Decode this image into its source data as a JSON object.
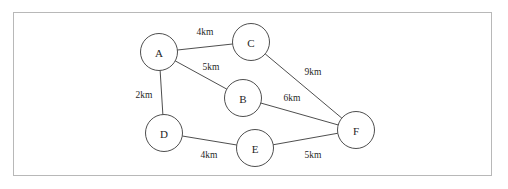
{
  "diagram": {
    "background_color": "#ffffff",
    "frame": {
      "border_color": "#b8b8b8",
      "x": 13,
      "y": 12,
      "width": 479,
      "height": 164
    },
    "node_style": {
      "radius": 18.5,
      "stroke_color": "#3a3a3a",
      "fill_color": "#ffffff"
    },
    "edge_style": {
      "stroke_color": "#3a3a3a",
      "unit": "km"
    }
  },
  "chart_data": {
    "type": "diagram",
    "graph_type": "undirected-weighted-graph",
    "title": "",
    "nodes": [
      {
        "id": "A",
        "label": "A",
        "x": 159,
        "y": 52
      },
      {
        "id": "B",
        "label": "B",
        "x": 243,
        "y": 98
      },
      {
        "id": "C",
        "label": "C",
        "x": 251,
        "y": 42
      },
      {
        "id": "D",
        "label": "D",
        "x": 164,
        "y": 133
      },
      {
        "id": "E",
        "label": "E",
        "x": 255,
        "y": 148
      },
      {
        "id": "F",
        "label": "F",
        "x": 356,
        "y": 130
      }
    ],
    "edges": [
      {
        "from": "A",
        "to": "C",
        "weight": 4,
        "label": "4km",
        "label_x": 205,
        "label_y": 32
      },
      {
        "from": "A",
        "to": "B",
        "weight": 5,
        "label": "5km",
        "label_x": 211,
        "label_y": 67
      },
      {
        "from": "A",
        "to": "D",
        "weight": 2,
        "label": "2km",
        "label_x": 144,
        "label_y": 95
      },
      {
        "from": "C",
        "to": "F",
        "weight": 9,
        "label": "9km",
        "label_x": 313,
        "label_y": 72
      },
      {
        "from": "B",
        "to": "F",
        "weight": 6,
        "label": "6km",
        "label_x": 292,
        "label_y": 98
      },
      {
        "from": "D",
        "to": "E",
        "weight": 4,
        "label": "4km",
        "label_x": 209,
        "label_y": 155
      },
      {
        "from": "E",
        "to": "F",
        "weight": 5,
        "label": "5km",
        "label_x": 313,
        "label_y": 155
      }
    ]
  }
}
